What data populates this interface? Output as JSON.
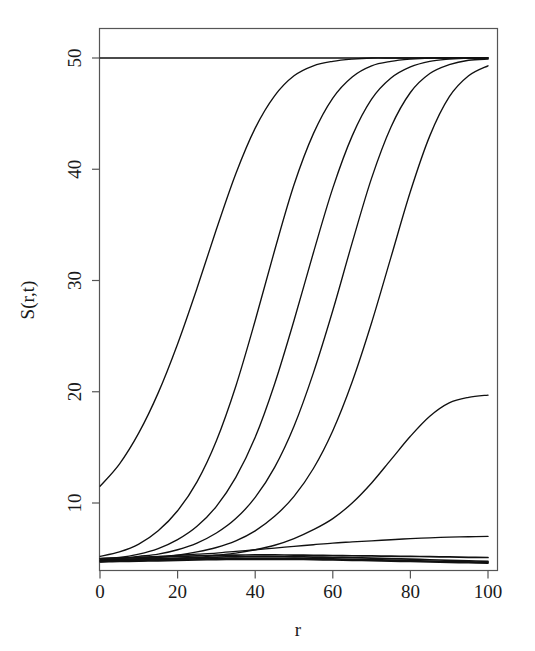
{
  "chart_data": {
    "type": "line",
    "title": "",
    "xlabel": "r",
    "ylabel": "S(r,t)",
    "xlim": [
      0,
      100
    ],
    "ylim": [
      4.2,
      51.5
    ],
    "grid": false,
    "legend": null,
    "x_ticks": [
      0,
      20,
      40,
      60,
      80,
      100
    ],
    "x_tick_labels": [
      "0",
      "20",
      "40",
      "60",
      "80",
      "100"
    ],
    "y_ticks": [
      10,
      20,
      30,
      40,
      50
    ],
    "y_tick_labels": [
      "10",
      "20",
      "30",
      "40",
      "50"
    ],
    "line_color": "#111111",
    "background_color": "#ffffff",
    "axis_color": "#555555",
    "x": [
      0,
      5,
      10,
      15,
      20,
      25,
      30,
      35,
      40,
      45,
      50,
      55,
      60,
      65,
      70,
      75,
      80,
      85,
      90,
      95,
      100
    ],
    "series": [
      {
        "name": "saturated",
        "description": "flat line held at carrying capacity across full domain",
        "values": [
          50.0,
          50.0,
          50.0,
          50.0,
          50.0,
          50.0,
          50.0,
          50.0,
          50.0,
          50.0,
          50.0,
          50.0,
          50.0,
          50.0,
          50.0,
          50.0,
          50.0,
          50.0,
          50.0,
          50.0,
          50.0
        ]
      },
      {
        "name": "wave-1",
        "description": "earliest wavefront, starts near 11.5 at r=0, saturates by r~35",
        "values": [
          11.5,
          13.5,
          16.3,
          19.9,
          24.3,
          29.3,
          34.6,
          39.6,
          43.7,
          46.6,
          48.4,
          49.3,
          49.7,
          49.9,
          50.0,
          50.0,
          50.0,
          50.0,
          50.0,
          50.0,
          50.0
        ]
      },
      {
        "name": "wave-2",
        "description": "wavefront with midpoint near r=30",
        "values": [
          5.2,
          5.6,
          6.3,
          7.5,
          9.3,
          11.9,
          15.6,
          20.5,
          26.4,
          32.7,
          38.6,
          43.2,
          46.4,
          48.3,
          49.3,
          49.7,
          49.9,
          50.0,
          50.0,
          50.0,
          50.0
        ]
      },
      {
        "name": "wave-3",
        "description": "wavefront with midpoint near r=45",
        "values": [
          5.0,
          5.1,
          5.4,
          5.9,
          6.7,
          7.9,
          9.7,
          12.3,
          15.9,
          20.7,
          26.4,
          32.5,
          38.3,
          43.0,
          46.3,
          48.2,
          49.2,
          49.7,
          49.9,
          50.0,
          50.0
        ]
      },
      {
        "name": "wave-4",
        "description": "wavefront with midpoint near r=61",
        "values": [
          4.9,
          5.0,
          5.2,
          5.4,
          5.8,
          6.4,
          7.3,
          8.6,
          10.5,
          13.2,
          16.9,
          21.7,
          27.3,
          33.4,
          39.2,
          43.8,
          46.9,
          48.6,
          49.4,
          49.8,
          49.9
        ]
      },
      {
        "name": "wave-5",
        "description": "wavefront with midpoint near r=79",
        "values": [
          4.8,
          4.9,
          5.0,
          5.1,
          5.3,
          5.6,
          6.0,
          6.6,
          7.5,
          8.8,
          10.6,
          13.1,
          16.5,
          20.9,
          26.2,
          32.1,
          38.0,
          43.0,
          46.5,
          48.4,
          49.3
        ]
      },
      {
        "name": "wave-6",
        "description": "latest wavefront, only reaches about 19.7 at r=100",
        "values": [
          4.7,
          4.8,
          4.8,
          4.9,
          5.0,
          5.1,
          5.3,
          5.5,
          5.8,
          6.2,
          6.8,
          7.6,
          8.6,
          10.0,
          11.8,
          13.9,
          16.0,
          17.8,
          19.0,
          19.5,
          19.7
        ]
      },
      {
        "name": "subcritical-1",
        "description": "slowly rising low curve reaching about 7.0 at r=100",
        "values": [
          5.0,
          5.05,
          5.1,
          5.2,
          5.3,
          5.4,
          5.5,
          5.65,
          5.8,
          5.95,
          6.1,
          6.25,
          6.4,
          6.5,
          6.6,
          6.7,
          6.8,
          6.87,
          6.93,
          6.97,
          7.0
        ]
      },
      {
        "name": "subcritical-2",
        "description": "near-flat curve, slight rise then decay back to about 5.1",
        "values": [
          5.0,
          5.05,
          5.1,
          5.15,
          5.2,
          5.25,
          5.3,
          5.32,
          5.33,
          5.33,
          5.32,
          5.3,
          5.28,
          5.26,
          5.24,
          5.22,
          5.2,
          5.18,
          5.15,
          5.12,
          5.1
        ]
      },
      {
        "name": "decaying-1",
        "description": "thick dark band member, starts near 4.85 with gentle bulge then decay",
        "values": [
          4.85,
          4.9,
          4.95,
          5.0,
          5.05,
          5.1,
          5.14,
          5.16,
          5.17,
          5.17,
          5.16,
          5.14,
          5.12,
          5.09,
          5.05,
          5.0,
          4.95,
          4.9,
          4.85,
          4.8,
          4.76
        ]
      },
      {
        "name": "decaying-2",
        "description": "thick dark band member, monotone slow decay",
        "values": [
          4.8,
          4.82,
          4.86,
          4.9,
          4.94,
          4.98,
          5.0,
          5.02,
          5.03,
          5.03,
          5.02,
          5.0,
          4.97,
          4.94,
          4.9,
          4.86,
          4.82,
          4.78,
          4.74,
          4.7,
          4.68
        ]
      },
      {
        "name": "decaying-3",
        "description": "thick dark band member, lowest curve",
        "values": [
          4.72,
          4.74,
          4.77,
          4.8,
          4.84,
          4.88,
          4.91,
          4.93,
          4.94,
          4.94,
          4.93,
          4.91,
          4.88,
          4.85,
          4.82,
          4.78,
          4.74,
          4.7,
          4.66,
          4.63,
          4.6
        ]
      }
    ]
  },
  "axes": {
    "y_label": "S(r,t)",
    "x_label": "r"
  }
}
